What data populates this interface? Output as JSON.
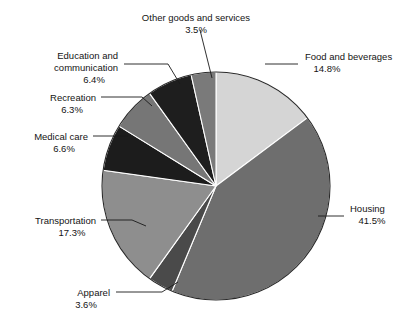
{
  "chart_data": {
    "type": "pie",
    "title": "",
    "subtitle": "",
    "xlabel": "",
    "ylabel": "",
    "legend_position": "none",
    "grid": false,
    "start_angle_deg": 0,
    "direction": "clockwise",
    "units": "percent",
    "total": 100.0,
    "categories": [
      "Food and beverages",
      "Housing",
      "Apparel",
      "Transportation",
      "Medical care",
      "Recreation",
      "Education and communication",
      "Other goods and services"
    ],
    "values": [
      14.8,
      41.5,
      3.6,
      17.3,
      6.6,
      6.3,
      6.4,
      3.5
    ],
    "slices": [
      {
        "name": "Food and beverages",
        "label_line1": "Food and beverages",
        "label_line2": "",
        "pct_text": "14.8%",
        "value": 14.8,
        "color": "#d5d5d5",
        "start_deg": 0.0,
        "end_deg": 53.28,
        "label_x": 305,
        "label_y": 60,
        "label_anchor": "start",
        "leader": [
          [
            265,
            64
          ],
          [
            298,
            64
          ]
        ]
      },
      {
        "name": "Housing",
        "label_line1": "Housing",
        "label_line2": "",
        "pct_text": "41.5%",
        "value": 41.5,
        "color": "#6e6e6e",
        "start_deg": 53.28,
        "end_deg": 202.68,
        "label_x": 350,
        "label_y": 212,
        "label_anchor": "start",
        "leader": [
          [
            318,
            216
          ],
          [
            344,
            216
          ]
        ]
      },
      {
        "name": "Apparel",
        "label_line1": "Apparel",
        "label_line2": "",
        "pct_text": "3.6%",
        "value": 3.6,
        "color": "#4a4a4a",
        "start_deg": 202.68,
        "end_deg": 215.64,
        "label_x": 110,
        "label_y": 296,
        "label_anchor": "end",
        "leader": [
          [
            116,
            292
          ],
          [
            162,
            292
          ],
          [
            178,
            282
          ]
        ]
      },
      {
        "name": "Transportation",
        "label_line1": "Transportation",
        "label_line2": "",
        "pct_text": "17.3%",
        "value": 17.3,
        "color": "#8e8e8e",
        "start_deg": 215.64,
        "end_deg": 277.92,
        "label_x": 96,
        "label_y": 224,
        "label_anchor": "end",
        "leader": [
          [
            101,
            220
          ],
          [
            132,
            220
          ],
          [
            146,
            226
          ]
        ]
      },
      {
        "name": "Medical care",
        "label_line1": "Medical care",
        "label_line2": "",
        "pct_text": "6.6%",
        "value": 6.6,
        "color": "#1c1c1c",
        "start_deg": 277.92,
        "end_deg": 301.68,
        "label_x": 88,
        "label_y": 140,
        "label_anchor": "end",
        "leader": [
          [
            93,
            136
          ],
          [
            128,
            136
          ]
        ]
      },
      {
        "name": "Recreation",
        "label_line1": "Recreation",
        "label_line2": "",
        "pct_text": "6.3%",
        "value": 6.3,
        "color": "#767676",
        "start_deg": 301.68,
        "end_deg": 324.36,
        "label_x": 96,
        "label_y": 101,
        "label_anchor": "end",
        "leader": [
          [
            101,
            97
          ],
          [
            142,
            97
          ],
          [
            152,
            106
          ]
        ]
      },
      {
        "name": "Education and communication",
        "label_line1": "Education and",
        "label_line2": "communication",
        "pct_text": "6.4%",
        "value": 6.4,
        "color": "#1e1e1e",
        "start_deg": 324.36,
        "end_deg": 347.4,
        "label_x": 118,
        "label_y": 59,
        "label_anchor": "end",
        "leader": [
          [
            124,
            64
          ],
          [
            168,
            64
          ],
          [
            180,
            84
          ]
        ]
      },
      {
        "name": "Other goods and services",
        "label_line1": "Other goods and services",
        "label_line2": "",
        "pct_text": "3.5%",
        "value": 3.5,
        "color": "#7a7a7a",
        "start_deg": 347.4,
        "end_deg": 360.0,
        "label_x": 196,
        "label_y": 21,
        "label_anchor": "middle",
        "leader": [
          [
            200,
            30
          ],
          [
            212,
            78
          ]
        ]
      }
    ]
  },
  "geometry": {
    "center_x": 216,
    "center_y": 186,
    "radius": 114
  }
}
